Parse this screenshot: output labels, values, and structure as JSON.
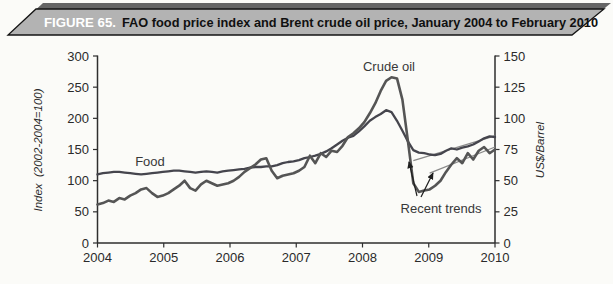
{
  "figure": {
    "label": "FIGURE 65.",
    "title": "FAO food price index and Brent crude oil price, January 2004 to February 2010"
  },
  "chart_data": {
    "type": "line",
    "title": "FAO food price index and Brent crude oil price, January 2004 to February 2010",
    "grid": "off",
    "legend": "inline-labels",
    "x": {
      "start": "2004-01",
      "end": "2010-02",
      "ticks": [
        "2004",
        "2005",
        "2006",
        "2007",
        "2008",
        "2009",
        "2010"
      ]
    },
    "y_left": {
      "label": "Index  (2002-2004=100)",
      "min": 0,
      "max": 300,
      "ticks": [
        "300",
        "250",
        "200",
        "150",
        "100",
        "50",
        "0"
      ]
    },
    "y_right": {
      "label": "US$/Barrel",
      "min": 0,
      "max": 150,
      "ticks": [
        "150",
        "125",
        "100",
        "75",
        "50",
        "25",
        "0"
      ]
    },
    "series": [
      {
        "name": "Food",
        "axis": "left",
        "values": [
          110,
          112,
          113,
          114,
          114,
          113,
          112,
          111,
          110,
          111,
          112,
          113,
          114,
          115,
          116,
          116,
          115,
          114,
          113,
          114,
          115,
          114,
          113,
          115,
          116,
          117,
          118,
          119,
          121,
          122,
          122,
          123,
          123,
          125,
          128,
          130,
          131,
          133,
          136,
          138,
          140,
          143,
          147,
          152,
          158,
          164,
          169,
          172,
          179,
          187,
          196,
          202,
          207,
          213,
          210,
          196,
          180,
          163,
          149,
          145,
          144,
          142,
          141,
          143,
          148,
          152,
          150,
          153,
          155,
          158,
          163,
          168,
          171,
          170
        ]
      },
      {
        "name": "Crude oil",
        "axis": "right",
        "values": [
          31,
          32,
          34,
          33,
          36,
          35,
          38,
          40,
          43,
          44,
          40,
          37,
          38,
          40,
          43,
          46,
          50,
          44,
          42,
          47,
          50,
          48,
          46,
          47,
          48,
          50,
          53,
          57,
          60,
          63,
          67,
          68,
          58,
          52,
          54,
          55,
          56,
          58,
          61,
          70,
          64,
          72,
          69,
          74,
          73,
          78,
          85,
          88,
          92,
          97,
          104,
          112,
          122,
          130,
          133,
          132,
          115,
          82,
          48,
          41,
          42,
          43,
          46,
          50,
          57,
          63,
          68,
          64,
          72,
          67,
          74,
          77,
          72,
          75
        ]
      }
    ],
    "trend_lines": [
      {
        "name": "Food recent trend",
        "axis": "left",
        "start_month": 58,
        "start_value": 132,
        "end_month": 73,
        "end_value": 172
      },
      {
        "name": "Crude oil recent trend",
        "axis": "right",
        "start_month": 61,
        "start_value": 56,
        "end_month": 73,
        "end_value": 77
      }
    ],
    "annotations": {
      "food_label": "Food",
      "crude_label": "Crude oil",
      "recent_trends_label": "Recent trends"
    },
    "colors": {
      "food_line": "#45454d",
      "crude_line": "#555555",
      "trend_line": "#8a8a8a",
      "axis": "#2e2e2e",
      "banner_fill": "#b3b3b3",
      "banner_shadow": "#656565"
    }
  }
}
